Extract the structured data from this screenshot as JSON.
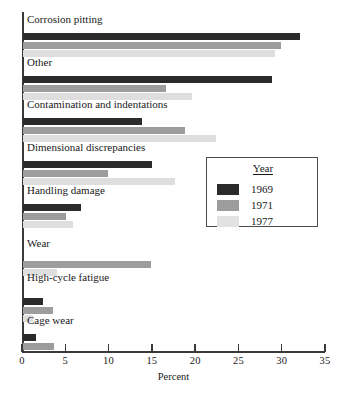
{
  "chart_data": {
    "type": "bar",
    "orientation": "horizontal",
    "title": "",
    "xlabel": "Percent",
    "ylabel": "",
    "xlim": [
      0,
      35
    ],
    "xticks": [
      0,
      5,
      10,
      15,
      20,
      25,
      30,
      35
    ],
    "grid": false,
    "legend": {
      "title": "Year",
      "position": "middle-right",
      "entries": [
        {
          "name": "1969",
          "color": "#2b2b2b"
        },
        {
          "name": "1971",
          "color": "#9d9d9d"
        },
        {
          "name": "1977",
          "color": "#dedede"
        }
      ]
    },
    "categories": [
      "Corrosion pitting",
      "Other",
      "Contamination and indentations",
      "Dimensional discrepancies",
      "Handling damage",
      "Wear",
      "High-cycle fatigue",
      "Cage wear"
    ],
    "series": [
      {
        "name": "1969",
        "color": "#2b2b2b",
        "values": [
          32.0,
          28.8,
          13.8,
          14.9,
          6.7,
          0.0,
          2.3,
          1.5
        ]
      },
      {
        "name": "1971",
        "color": "#9d9d9d",
        "values": [
          29.8,
          16.5,
          18.7,
          9.8,
          5.0,
          14.8,
          3.5,
          3.6
        ]
      },
      {
        "name": "1977",
        "color": "#dedede",
        "values": [
          29.1,
          19.5,
          22.3,
          17.5,
          5.8,
          3.9,
          1.1,
          0.0
        ]
      }
    ]
  },
  "colors": {
    "axis": "#3a3a3a",
    "text": "#1a1a1a",
    "background": "#ffffff",
    "legend_border": "#4a4a4a"
  }
}
